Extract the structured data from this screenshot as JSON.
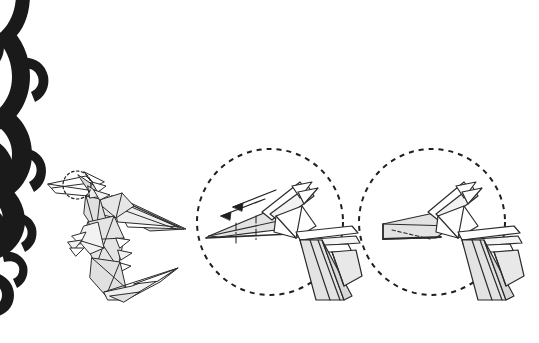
{
  "page": {
    "kind": "origami-instruction-illustration",
    "background_color": "#ffffff",
    "width": 539,
    "height": 343,
    "caption": ""
  },
  "ornament": {
    "name": "decorative-scroll-flourish",
    "position": "left-edge",
    "color": "#1a1a1a",
    "description": "black calligraphic spiral scrollwork running down the left margin"
  },
  "style": {
    "outline_color": "#2b2b2b",
    "paper_front_color": "#ffffff",
    "paper_shade_color": "#e3e3e3",
    "paper_shade_dark_color": "#cfcfcf",
    "callout_circle_color": "#1f1f1f",
    "crease_color": "#2b2b2b",
    "arrow_color": "#1f1f1f"
  },
  "figures": [
    {
      "id": "main-model",
      "name": "origami-pterodactyl-figure",
      "label": "",
      "description": "completed origami flying dragon / pterodactyl seen from the side with long swept wing, legs and tail",
      "highlight": {
        "name": "head-highlight-circle",
        "shape": "dashed-circle",
        "cx": 77,
        "cy": 185,
        "r": 14
      }
    },
    {
      "id": "detail-before",
      "name": "detail-circle-before-fold",
      "label": "",
      "description": "enlarged view of the head before folding: long pointed beak with two dash-dot crease lines and two fold arrows pointing left",
      "circle": {
        "cx": 270,
        "cy": 222,
        "r": 73
      },
      "creases": 2,
      "arrows": [
        {
          "name": "fold-arrow-upper",
          "direction": "left"
        },
        {
          "name": "fold-arrow-lower",
          "direction": "left"
        }
      ]
    },
    {
      "id": "detail-after",
      "name": "detail-circle-after-fold",
      "label": "",
      "description": "enlarged view of the head after folding: beak shortened into a blunt squared snout with hidden dashed edge",
      "circle": {
        "cx": 432,
        "cy": 222,
        "r": 73
      },
      "creases": 1,
      "arrows": []
    }
  ]
}
